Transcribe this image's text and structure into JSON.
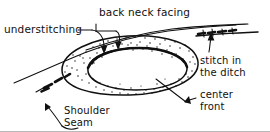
{
  "figure": {
    "medium": "hand-drawn line illustration",
    "ink_color": "#101010",
    "background_color": "#ffffff"
  },
  "labels": {
    "understitching": "understitching",
    "back_neck_facing": "back neck facing",
    "stitch_in_the_ditch_line1": "stitch in",
    "stitch_in_the_ditch_line2": "the ditch",
    "center_front_line1": "center",
    "center_front_line2": "front",
    "shoulder_seam_line1": "Shoulder",
    "shoulder_seam_line2": "Seam"
  },
  "parts": {
    "neckline_opening": "neckline-opening",
    "facing_band": "stippled-facing-band",
    "garment_body": "garment-body",
    "shoulder_seam_stitching": "shoulder-seam-dashes",
    "ditch_stitching": "ditch-stitch-dashes",
    "understitching_run": "understitching-dashes"
  }
}
